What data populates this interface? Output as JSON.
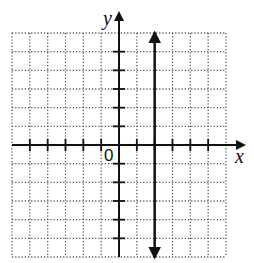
{
  "chart_data": {
    "type": "line",
    "title": "",
    "xlabel": "x",
    "ylabel": "y",
    "origin_label": "0",
    "xlim": [
      -6,
      6
    ],
    "ylim": [
      -6,
      6
    ],
    "grid": true,
    "grid_style": "dotted",
    "series": [
      {
        "name": "vertical line x = 2",
        "equation": "x = 2",
        "x": [
          2,
          2
        ],
        "y": [
          -6,
          6
        ],
        "arrows": "both"
      }
    ]
  },
  "labels": {
    "x_axis": "x",
    "y_axis": "y",
    "origin": "0"
  }
}
